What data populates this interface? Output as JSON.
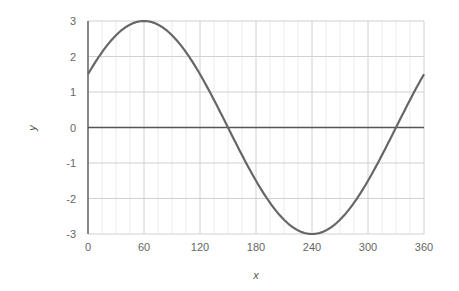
{
  "chart_data": {
    "type": "line",
    "title": "",
    "xlabel": "x",
    "ylabel": "y",
    "xlim": [
      0,
      360
    ],
    "ylim": [
      -3,
      3
    ],
    "x_ticks": [
      0,
      60,
      120,
      180,
      240,
      300,
      360
    ],
    "y_ticks": [
      3,
      2,
      1,
      0,
      -1,
      -2,
      -3
    ],
    "x_minor_step": 15,
    "grid": true,
    "legend": null,
    "series": [
      {
        "name": "y = 3·sin(x + 30°)",
        "color": "#666666",
        "x": [
          0,
          15,
          30,
          45,
          60,
          75,
          90,
          105,
          120,
          135,
          150,
          165,
          180,
          195,
          210,
          225,
          240,
          255,
          270,
          285,
          300,
          315,
          330,
          345,
          360
        ],
        "values": [
          1.5,
          2.12,
          2.6,
          2.9,
          3.0,
          2.9,
          2.6,
          2.12,
          1.5,
          0.78,
          0.0,
          -0.78,
          -1.5,
          -2.12,
          -2.6,
          -2.9,
          -3.0,
          -2.9,
          -2.6,
          -2.12,
          -1.5,
          -0.78,
          0.0,
          0.78,
          1.5
        ]
      }
    ]
  },
  "colors": {
    "curve": "#666666",
    "zero_line": "#555555",
    "major_grid": "#d0d0d0",
    "minor_grid": "#ebebeb",
    "left_axis": "#555555",
    "tick_text": "#666666"
  }
}
